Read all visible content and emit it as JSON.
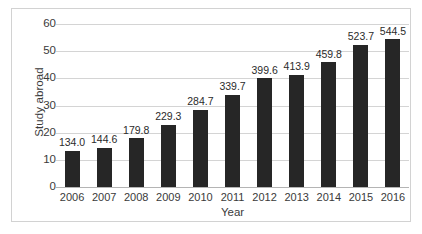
{
  "chart_data": {
    "type": "bar",
    "title": "",
    "subtitle": "",
    "xlabel": "Year",
    "ylabel": "Study abroad",
    "categories": [
      "2006",
      "2007",
      "2008",
      "2009",
      "2010",
      "2011",
      "2012",
      "2013",
      "2014",
      "2015",
      "2016"
    ],
    "values": [
      13.4,
      14.46,
      17.98,
      22.93,
      28.47,
      33.97,
      39.96,
      41.39,
      45.98,
      52.37,
      54.45
    ],
    "data_labels": [
      "134.0",
      "144.6",
      "179.8",
      "229.3",
      "284.7",
      "339.7",
      "399.6",
      "413.9",
      "459.8",
      "523.7",
      "544.5"
    ],
    "ylim": [
      0,
      60
    ],
    "yticks": [
      0,
      10,
      20,
      30,
      40,
      50,
      60
    ],
    "ytick_labels": [
      "0",
      "10",
      "20",
      "30",
      "40",
      "50",
      "60"
    ],
    "grid": true,
    "grid_axis": "y",
    "legend": false,
    "legend_position": "none",
    "bar_color": "#262626",
    "gridline_color": "#d4d4d4",
    "axis_text_color": "#3a3a3a",
    "label_text_color": "#2b2b2b",
    "background_color": "#ffffff",
    "border_color": "#d2d2d2"
  }
}
